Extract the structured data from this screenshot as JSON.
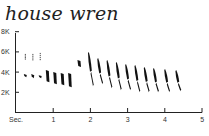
{
  "chart_data": {
    "type": "spectrogram",
    "title": "house wren",
    "xlabel": "Sec.",
    "ylabel": "",
    "x_ticks": [
      "1",
      "2",
      "3",
      "4",
      "5"
    ],
    "y_ticks": [
      "2K",
      "4K",
      "6K",
      "8K"
    ],
    "xlim": [
      0,
      5
    ],
    "ylim": [
      0,
      8000
    ],
    "grid": false,
    "legend": null,
    "syllables": [
      {
        "t": 0.25,
        "f_low": 5200,
        "f_high": 5800
      },
      {
        "t": 0.25,
        "f_low": 3500,
        "f_high": 3800
      },
      {
        "t": 0.45,
        "f_low": 5100,
        "f_high": 5800
      },
      {
        "t": 0.45,
        "f_low": 3400,
        "f_high": 3800
      },
      {
        "t": 0.65,
        "f_low": 5100,
        "f_high": 5900
      },
      {
        "t": 0.65,
        "f_low": 3400,
        "f_high": 3700
      },
      {
        "t": 0.85,
        "f_low": 3000,
        "f_high": 4200
      },
      {
        "t": 1.05,
        "f_low": 2800,
        "f_high": 4000
      },
      {
        "t": 1.25,
        "f_low": 2700,
        "f_high": 3900
      },
      {
        "t": 1.45,
        "f_low": 2500,
        "f_high": 3900
      },
      {
        "t": 1.7,
        "f_low": 4500,
        "f_high": 5200
      },
      {
        "t": 2.0,
        "f_low": 2600,
        "f_high": 6000
      },
      {
        "t": 2.25,
        "f_low": 2800,
        "f_high": 5400
      },
      {
        "t": 2.5,
        "f_low": 2400,
        "f_high": 5200
      },
      {
        "t": 2.75,
        "f_low": 2200,
        "f_high": 5000
      },
      {
        "t": 3.0,
        "f_low": 2200,
        "f_high": 4800
      },
      {
        "t": 3.25,
        "f_low": 2000,
        "f_high": 4700
      },
      {
        "t": 3.5,
        "f_low": 2000,
        "f_high": 4500
      },
      {
        "t": 3.75,
        "f_low": 2000,
        "f_high": 4400
      },
      {
        "t": 4.05,
        "f_low": 2000,
        "f_high": 4300
      },
      {
        "t": 4.35,
        "f_low": 2100,
        "f_high": 4200
      }
    ]
  },
  "colors": {
    "ink": "#111111",
    "axis": "#222222",
    "background": "#ffffff"
  }
}
